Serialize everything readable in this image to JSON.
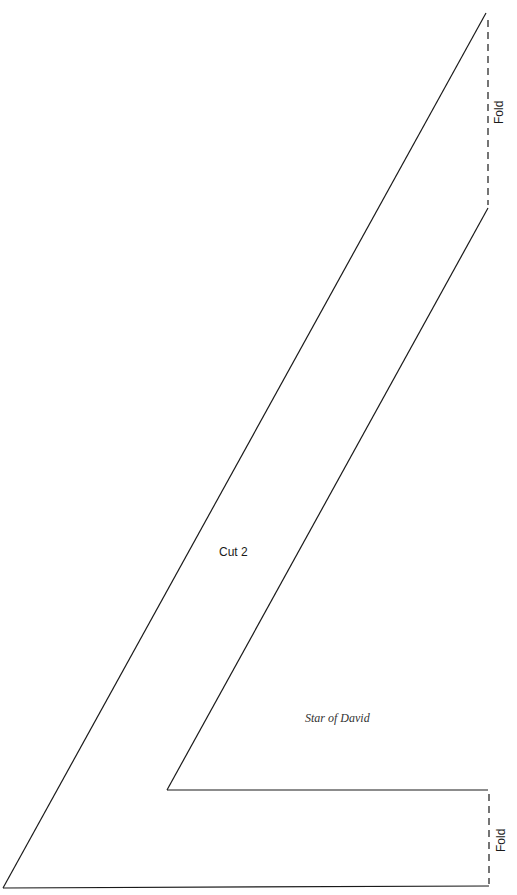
{
  "pattern": {
    "title": "Star of David",
    "instruction": "Cut 2",
    "fold_labels": {
      "top": "Fold",
      "bottom": "Fold"
    },
    "colors": {
      "line": "#1a1a1a",
      "background": "#ffffff"
    },
    "shape": {
      "outer_top_right": [
        486,
        13
      ],
      "inner_top_right": [
        488,
        208
      ],
      "inner_corner": [
        167,
        790
      ],
      "inner_bottom_right": [
        488,
        790
      ],
      "outer_bottom_left": [
        3,
        888
      ],
      "outer_bottom_right": [
        489,
        886
      ]
    }
  }
}
